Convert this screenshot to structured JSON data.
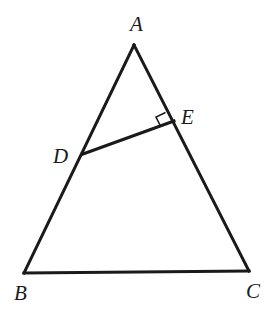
{
  "diagram": {
    "type": "geometry",
    "points": {
      "A": {
        "label": "A",
        "x": 134,
        "y": 45
      },
      "B": {
        "label": "B",
        "x": 24,
        "y": 273
      },
      "C": {
        "label": "C",
        "x": 249,
        "y": 271
      },
      "D": {
        "label": "D",
        "x": 83,
        "y": 154
      },
      "E": {
        "label": "E",
        "x": 174,
        "y": 121
      }
    },
    "segments": [
      "AB",
      "BC",
      "CA",
      "DE"
    ],
    "right_angle_at": "E",
    "colors": {
      "stroke": "#1a1a1a",
      "background": "#ffffff"
    }
  }
}
